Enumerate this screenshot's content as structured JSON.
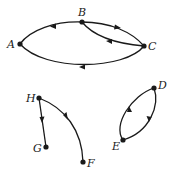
{
  "diagram": {
    "type": "directed-graph",
    "nodes": [
      {
        "id": "A",
        "label": "A"
      },
      {
        "id": "B",
        "label": "B"
      },
      {
        "id": "C",
        "label": "C"
      },
      {
        "id": "D",
        "label": "D"
      },
      {
        "id": "E",
        "label": "E"
      },
      {
        "id": "F",
        "label": "F"
      },
      {
        "id": "G",
        "label": "G"
      },
      {
        "id": "H",
        "label": "H"
      }
    ],
    "edges": [
      {
        "from": "B",
        "to": "A"
      },
      {
        "from": "B",
        "to": "C"
      },
      {
        "from": "C",
        "to": "B"
      },
      {
        "from": "C",
        "to": "A"
      },
      {
        "from": "D",
        "to": "E"
      },
      {
        "from": "E",
        "to": "D"
      },
      {
        "from": "H",
        "to": "G"
      },
      {
        "from": "H",
        "to": "F"
      }
    ]
  }
}
